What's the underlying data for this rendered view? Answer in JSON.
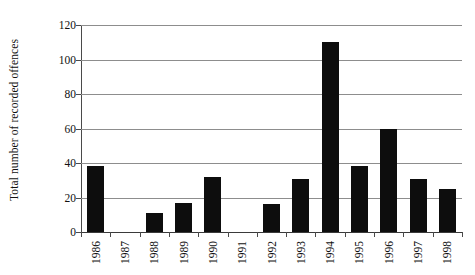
{
  "chart_data": {
    "type": "bar",
    "title": "",
    "subtitle": "",
    "xlabel": "",
    "ylabel": "Total number of recorded offences",
    "categories": [
      "1986",
      "1987",
      "1988",
      "1989",
      "1990",
      "1991",
      "1992",
      "1993",
      "1994",
      "1995",
      "1996",
      "1997",
      "1998"
    ],
    "values": [
      38,
      0,
      11,
      17,
      32,
      0,
      16,
      31,
      110,
      38,
      60,
      31,
      25
    ],
    "series": [
      {
        "name": "Total number of recorded offences",
        "values": [
          38,
          0,
          11,
          17,
          32,
          0,
          16,
          31,
          110,
          38,
          60,
          31,
          25
        ]
      }
    ],
    "ylim": [
      0,
      120
    ],
    "xlim": [
      0,
      13
    ],
    "ytick_labels": [
      "0",
      "20",
      "40",
      "60",
      "80",
      "100",
      "120"
    ],
    "ytick_values": [
      0,
      20,
      40,
      60,
      80,
      100,
      120
    ],
    "grid": "horizontal",
    "legend": "none",
    "bar_color": "#0d0d0d",
    "gridline_color": "#8d8d8d",
    "axis_color": "#4a4a4a",
    "background_color": "#ffffff",
    "annotations": []
  }
}
